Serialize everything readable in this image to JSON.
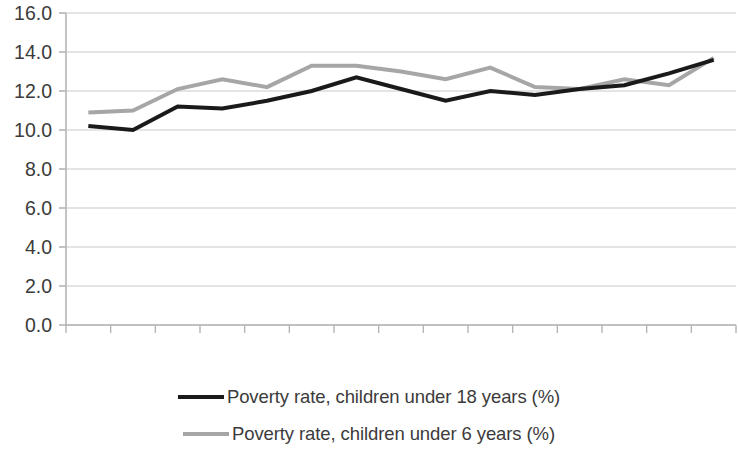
{
  "chart_data": {
    "type": "line",
    "title": "",
    "subtitle": "",
    "xlabel": "",
    "ylabel": "",
    "categories": [
      "2004",
      "2005",
      "2006",
      "2007",
      "2008",
      "2009",
      "2010",
      "2011",
      "2012",
      "2013",
      "2014",
      "2015",
      "2016",
      "2017",
      "2018"
    ],
    "ylim": [
      0.0,
      16.0
    ],
    "ytick_labels": [
      "0.0",
      "2.0",
      "4.0",
      "6.0",
      "8.0",
      "10.0",
      "12.0",
      "14.0",
      "16.0"
    ],
    "ytick_values": [
      0.0,
      2.0,
      4.0,
      6.0,
      8.0,
      10.0,
      12.0,
      14.0,
      16.0
    ],
    "grid": true,
    "grid_axis": "y",
    "legend_position": "bottom",
    "series": [
      {
        "name": "Poverty rate, children under 18 years (%)",
        "color": "#1a1a1a",
        "line_width": 4,
        "values": [
          10.2,
          10.0,
          11.2,
          11.1,
          11.5,
          12.0,
          12.7,
          12.1,
          11.5,
          12.0,
          11.8,
          12.1,
          12.3,
          12.9,
          13.6
        ]
      },
      {
        "name": "Poverty rate, children under 6 years (%)",
        "color": "#a6a6a6",
        "line_width": 4,
        "values": [
          10.9,
          11.0,
          12.1,
          12.6,
          12.2,
          13.3,
          13.3,
          13.0,
          12.6,
          13.2,
          12.2,
          12.1,
          12.6,
          12.3,
          13.7
        ]
      }
    ]
  },
  "axis": {
    "y_axis_name": "y-axis",
    "x_axis_name": "x-axis"
  },
  "legend": {
    "items": [
      {
        "label": "Poverty rate, children under 18 years (%)",
        "color": "#1a1a1a",
        "width": "4px"
      },
      {
        "label": "Poverty rate, children under 6 years (%)",
        "color": "#a6a6a6",
        "width": "4px"
      }
    ]
  }
}
